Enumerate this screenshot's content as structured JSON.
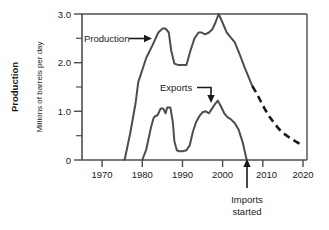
{
  "chart_data": {
    "type": "line",
    "title": "",
    "xlabel": "",
    "ylabel": "Millions of barrels per day",
    "ylabel_outer": "Production",
    "xlim": [
      1965,
      2021
    ],
    "ylim": [
      0,
      3.0
    ],
    "grid": false,
    "legend_position": "none",
    "x_ticks": [
      1970,
      1980,
      1990,
      2000,
      2010,
      2020
    ],
    "x_tick_labels": [
      "1970",
      "1980",
      "1990",
      "2000",
      "2010",
      "2020"
    ],
    "x_minor_ticks": [
      1975,
      1985,
      1995,
      2005,
      2015
    ],
    "y_ticks": [
      0,
      1.0,
      2.0,
      3.0
    ],
    "y_tick_labels": [
      "0",
      "1.0",
      "2.0",
      "3.0"
    ],
    "y_minor_ticks": [
      0.5,
      1.5,
      2.5
    ],
    "series": [
      {
        "name": "Production",
        "style": "solid",
        "color": "#4d4d4d",
        "x": [
          1975.6,
          1977.0,
          1978.3,
          1979.0,
          1979.6,
          1981.0,
          1982.5,
          1984.0,
          1985.0,
          1985.8,
          1986.6,
          1987.2,
          1988.0,
          1989.0,
          1989.8,
          1991.0,
          1992.0,
          1993.0,
          1994.0,
          1994.8,
          1995.6,
          1996.6,
          1997.4,
          1998.2,
          1999.0,
          2000.0,
          2001.0,
          2002.0,
          2003.0,
          2004.2,
          2005.4,
          2006.4,
          2007.4
        ],
        "y": [
          0.0,
          0.55,
          1.15,
          1.6,
          1.75,
          2.1,
          2.35,
          2.62,
          2.7,
          2.7,
          2.62,
          2.25,
          1.98,
          1.95,
          1.95,
          1.95,
          2.25,
          2.5,
          2.62,
          2.62,
          2.58,
          2.62,
          2.68,
          2.82,
          3.0,
          2.82,
          2.62,
          2.52,
          2.42,
          2.18,
          1.92,
          1.72,
          1.52
        ]
      },
      {
        "name": "Production projection",
        "style": "dashed",
        "color": "#1a1a1a",
        "x": [
          2007.4,
          2008.6,
          2010.0,
          2011.4,
          2012.8,
          2014.2,
          2015.6,
          2017.0,
          2018.4,
          2020.0
        ],
        "y": [
          1.52,
          1.35,
          1.12,
          0.92,
          0.76,
          0.62,
          0.52,
          0.44,
          0.37,
          0.3
        ]
      },
      {
        "name": "Exports",
        "style": "solid",
        "color": "#4d4d4d",
        "x": [
          1980.0,
          1981.0,
          1982.2,
          1982.8,
          1983.2,
          1983.8,
          1984.6,
          1985.2,
          1985.8,
          1986.2,
          1987.0,
          1987.6,
          1988.0,
          1988.6,
          1989.2,
          1990.0,
          1991.0,
          1991.8,
          1992.6,
          1993.4,
          1994.2,
          1995.0,
          1995.8,
          1996.6,
          1997.4,
          1998.2,
          1998.8,
          1999.6,
          2000.4,
          2001.2,
          2002.0,
          2003.0,
          2004.0,
          2005.0,
          2006.0
        ],
        "y": [
          0.0,
          0.22,
          0.68,
          0.86,
          0.9,
          0.92,
          1.06,
          1.06,
          0.96,
          1.08,
          1.08,
          0.78,
          0.38,
          0.2,
          0.18,
          0.18,
          0.2,
          0.3,
          0.58,
          0.78,
          0.9,
          0.98,
          1.0,
          0.96,
          1.06,
          1.16,
          1.22,
          1.1,
          0.96,
          0.88,
          0.84,
          0.76,
          0.62,
          0.36,
          0.0
        ]
      }
    ],
    "annotations": [
      {
        "id": "production-annotation",
        "text": "Production",
        "points_to_x": 1984.0,
        "points_to_y": 2.6,
        "arrow": "right"
      },
      {
        "id": "exports-annotation",
        "text": "Exports",
        "points_to_x": 1998.8,
        "points_to_y": 1.28,
        "arrow": "elbow-down"
      },
      {
        "id": "imports-started-annotation",
        "text_line1": "Imports",
        "text_line2": "started",
        "points_to_x": 2006.0,
        "points_to_y": 0.0,
        "arrow": "up"
      }
    ]
  }
}
